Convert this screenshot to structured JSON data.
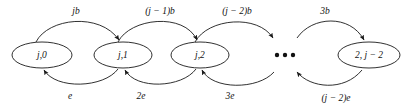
{
  "diagram": {
    "type": "state-transition-diagram",
    "title": "",
    "nodes": [
      {
        "id": "n0",
        "label": "j,0",
        "cx": 42,
        "cy": 55,
        "rx": 30,
        "ry": 13
      },
      {
        "id": "n1",
        "label": "j,1",
        "cx": 123,
        "cy": 55,
        "rx": 29,
        "ry": 13
      },
      {
        "id": "n2",
        "label": "j,2",
        "cx": 200,
        "cy": 55,
        "rx": 29,
        "ry": 13
      },
      {
        "id": "n3",
        "label": "2, j − 2",
        "cx": 369,
        "cy": 55,
        "rx": 31,
        "ry": 13
      }
    ],
    "ellipsis": {
      "label": "• • •",
      "cx": 285,
      "cy": 55,
      "dots": 3
    },
    "forward_edges": [
      {
        "from": "n0",
        "to": "n1",
        "label": "jb",
        "label_x": 76,
        "label_y": 12
      },
      {
        "from": "n1",
        "to": "n2",
        "label": "(j − 1)b",
        "label_x": 160,
        "label_y": 12
      },
      {
        "from": "n2",
        "to": "ellipsis",
        "label": "(j − 2)b",
        "label_x": 237,
        "label_y": 12
      },
      {
        "from": "ellipsis",
        "to": "n3",
        "label": "3b",
        "label_x": 325,
        "label_y": 12
      }
    ],
    "backward_edges": [
      {
        "from": "n1",
        "to": "n0",
        "label": "e",
        "label_x": 70,
        "label_y": 97
      },
      {
        "from": "n2",
        "to": "n1",
        "label": "2e",
        "label_x": 141,
        "label_y": 97
      },
      {
        "from": "ellipsis",
        "to": "n2",
        "label": "3e",
        "label_x": 230,
        "label_y": 97
      },
      {
        "from": "n3",
        "to": "ellipsis",
        "label": "(j − 2)e",
        "label_x": 336,
        "label_y": 99
      }
    ],
    "colors": {
      "stroke": "#1a1a1a",
      "text": "#111111",
      "background": "#ffffff"
    }
  }
}
